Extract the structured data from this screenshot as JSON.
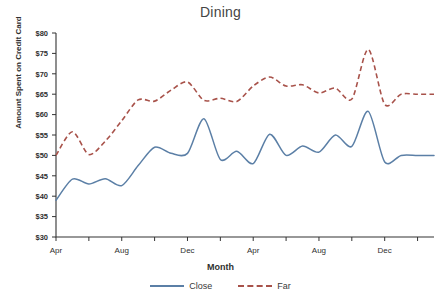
{
  "chart_data": {
    "type": "line",
    "title": "Dining",
    "xlabel": "Month",
    "ylabel": "Amount Spent on Credit Card",
    "ylim": [
      30,
      80
    ],
    "ytick_values": [
      30,
      35,
      40,
      45,
      50,
      55,
      60,
      65,
      70,
      75,
      80
    ],
    "ytick_labels": [
      "$30",
      "$35",
      "$40",
      "$45",
      "$50",
      "$55",
      "$60",
      "$65",
      "$70",
      "$75",
      "$80"
    ],
    "x_tick_labels": [
      "Apr",
      "Aug",
      "Dec",
      "Apr",
      "Aug",
      "Dec"
    ],
    "x_tick_indices": [
      0,
      4,
      8,
      12,
      16,
      20
    ],
    "x_count": 24,
    "grid": false,
    "legend_position": "bottom",
    "series": [
      {
        "name": "Close",
        "color": "#5B7FA6",
        "style": "solid",
        "values": [
          39.0,
          44.2,
          43.0,
          44.3,
          42.6,
          47.5,
          52.0,
          50.5,
          50.5,
          59.0,
          49.0,
          51.0,
          48.0,
          55.2,
          50.0,
          52.3,
          50.8,
          55.0,
          52.2,
          60.8,
          48.4,
          50.0,
          50.0,
          50.0
        ]
      },
      {
        "name": "Far",
        "color": "#A8524A",
        "style": "dashed",
        "values": [
          50.0,
          55.8,
          50.2,
          53.5,
          58.5,
          63.6,
          63.3,
          66.0,
          68.0,
          63.5,
          64.0,
          63.2,
          67.0,
          69.2,
          67.0,
          67.3,
          65.3,
          66.5,
          63.8,
          76.0,
          62.5,
          65.0,
          65.0,
          65.0
        ]
      }
    ]
  },
  "legend": {
    "items": [
      {
        "label": "Close"
      },
      {
        "label": "Far"
      }
    ]
  }
}
